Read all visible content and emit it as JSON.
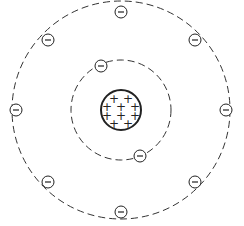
{
  "diagram": {
    "nucleus": {
      "center": [
        121,
        110
      ],
      "radius": 20,
      "charge_symbol": "+",
      "proton_count": 10,
      "plus_positions": [
        [
          114,
          99
        ],
        [
          128,
          99
        ],
        [
          107,
          107
        ],
        [
          121,
          107
        ],
        [
          135,
          107
        ],
        [
          107,
          116
        ],
        [
          121,
          116
        ],
        [
          135,
          116
        ],
        [
          114,
          124
        ],
        [
          128,
          124
        ]
      ]
    },
    "shells": [
      {
        "name": "inner",
        "radius": 50,
        "electron_count": 2,
        "electrons": [
          [
            101,
            66
          ],
          [
            140,
            156
          ]
        ]
      },
      {
        "name": "outer",
        "radius": 109,
        "electron_count": 8,
        "electrons": [
          [
            121,
            12
          ],
          [
            48,
            40
          ],
          [
            195,
            40
          ],
          [
            16,
            110
          ],
          [
            226,
            110
          ],
          [
            48,
            182
          ],
          [
            195,
            182
          ],
          [
            121,
            212
          ]
        ]
      }
    ],
    "electron_symbol": "−",
    "electron_radius": 6,
    "colors": {
      "stroke": "#222222",
      "orbit": "#333333",
      "background": "#ffffff"
    }
  }
}
